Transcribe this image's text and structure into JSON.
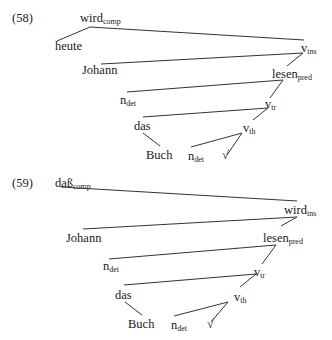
{
  "examples": [
    {
      "number": "(58)",
      "nodes": {
        "wird": {
          "text": "wird",
          "sub": "comp"
        },
        "heute": {
          "text": "heute",
          "sub": ""
        },
        "vtns": {
          "text": "v",
          "sub": "tns"
        },
        "johann": {
          "text": "Johann",
          "sub": ""
        },
        "lesen": {
          "text": "lesen",
          "sub": "pred"
        },
        "ndet1": {
          "text": "n",
          "sub": "det"
        },
        "vtr": {
          "text": "v",
          "sub": "tr"
        },
        "das": {
          "text": "das",
          "sub": ""
        },
        "vth": {
          "text": "v",
          "sub": "th"
        },
        "buch": {
          "text": "Buch",
          "sub": ""
        },
        "ndet2": {
          "text": "n",
          "sub": "det"
        },
        "root": {
          "text": "√",
          "sub": ""
        }
      }
    },
    {
      "number": "(59)",
      "nodes": {
        "dass": {
          "text": "daß",
          "sub": "comp"
        },
        "wird": {
          "text": "wird",
          "sub": "tns"
        },
        "johann": {
          "text": "Johann",
          "sub": ""
        },
        "lesen": {
          "text": "lesen",
          "sub": "pred"
        },
        "ndet1": {
          "text": "n",
          "sub": "det"
        },
        "vtr": {
          "text": "v",
          "sub": "tr"
        },
        "das": {
          "text": "das",
          "sub": ""
        },
        "vth": {
          "text": "v",
          "sub": "th"
        },
        "buch": {
          "text": "Buch",
          "sub": ""
        },
        "ndet2": {
          "text": "n",
          "sub": "det"
        },
        "root": {
          "text": "√",
          "sub": ""
        }
      }
    }
  ]
}
